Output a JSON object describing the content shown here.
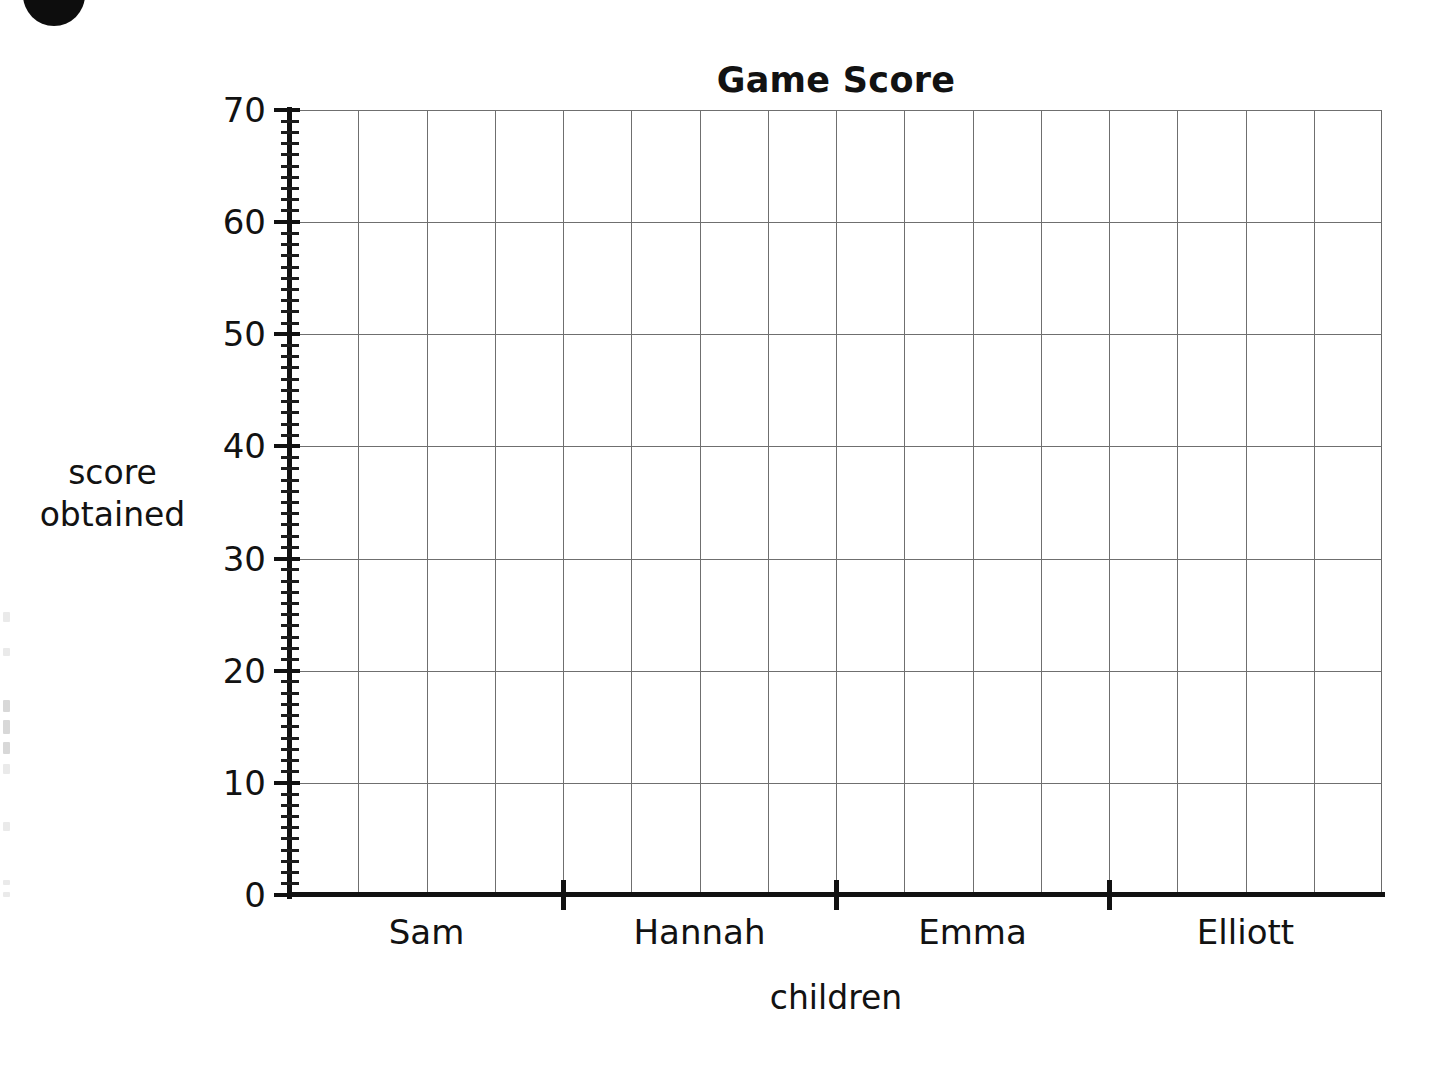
{
  "chart_data": {
    "type": "bar",
    "title": "Game Score",
    "xlabel": "children",
    "ylabel_lines": [
      "score",
      "obtained"
    ],
    "ylabel": "score obtained",
    "categories": [
      "Sam",
      "Hannah",
      "Emma",
      "Elliott"
    ],
    "values": [
      null,
      null,
      null,
      null
    ],
    "series": [
      {
        "name": "score obtained",
        "values": [
          null,
          null,
          null,
          null
        ]
      }
    ],
    "ylim": [
      0,
      70
    ],
    "y_major_ticks": [
      0,
      10,
      20,
      30,
      40,
      50,
      60,
      70
    ],
    "y_tick_labels": [
      "0",
      "10",
      "20",
      "30",
      "40",
      "50",
      "60",
      "70"
    ],
    "y_minor_tick_interval": 1,
    "x_columns": 16,
    "x_columns_per_category": 4,
    "grid": true,
    "grid_color": "#6f6f6f",
    "axis_color": "#111111",
    "legend": null,
    "note": "Blank grid template — axes and gridlines only, no bars plotted"
  },
  "worksheet": {
    "bullet_marker": "bullet-circle"
  },
  "y_axis": {
    "labels": [
      "70",
      "60",
      "50",
      "40",
      "30",
      "20",
      "10",
      "0"
    ],
    "title_lines": [
      "score",
      "obtained"
    ]
  },
  "x_axis": {
    "categories": [
      "Sam",
      "Hannah",
      "Emma",
      "Elliott"
    ],
    "title": "children"
  },
  "header": {
    "title": "Game Score"
  }
}
